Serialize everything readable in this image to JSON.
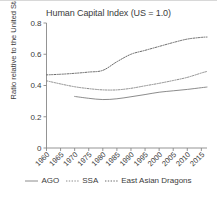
{
  "chart_data": {
    "type": "line",
    "title": "Human Capital Index (US = 1.0)",
    "xlabel": "",
    "ylabel": "Ratio relative to the United States",
    "xlim": [
      1960,
      2017
    ],
    "ylim": [
      0,
      0.8
    ],
    "grid": false,
    "legend_position": "bottom",
    "x_ticks": [
      1960,
      1965,
      1970,
      1975,
      1980,
      1985,
      1990,
      1995,
      2000,
      2005,
      2010,
      2015
    ],
    "x_tick_labels": [
      "1960",
      "1965",
      "1970",
      "1975",
      "1980",
      "1985",
      "1990",
      "1995",
      "2000",
      "2005",
      "2010",
      "2015"
    ],
    "y_ticks": [
      0,
      0.2,
      0.4,
      0.6,
      0.8
    ],
    "y_tick_labels": [
      "0",
      "0.2",
      "0.4",
      "0.6",
      "0.8"
    ],
    "series": [
      {
        "name": "AGO",
        "style": "solid",
        "color": "#8c8c8c",
        "x": [
          1970,
          1975,
          1980,
          1985,
          1990,
          1995,
          2000,
          2005,
          2010,
          2015,
          2017
        ],
        "values": [
          0.33,
          0.318,
          0.31,
          0.315,
          0.328,
          0.342,
          0.357,
          0.366,
          0.375,
          0.386,
          0.39
        ]
      },
      {
        "name": "SSA",
        "style": "dotted",
        "color": "#8c8c8c",
        "x": [
          1960,
          1965,
          1970,
          1975,
          1980,
          1985,
          1990,
          1995,
          2000,
          2005,
          2010,
          2015,
          2017
        ],
        "values": [
          0.43,
          0.41,
          0.392,
          0.38,
          0.372,
          0.372,
          0.382,
          0.398,
          0.414,
          0.432,
          0.452,
          0.48,
          0.49
        ]
      },
      {
        "name": "East Asian Dragons",
        "style": "dotted",
        "color": "#6b6b6b",
        "x": [
          1960,
          1965,
          1970,
          1975,
          1980,
          1985,
          1990,
          1995,
          2000,
          2005,
          2010,
          2015,
          2017
        ],
        "values": [
          0.468,
          0.472,
          0.478,
          0.486,
          0.497,
          0.552,
          0.6,
          0.625,
          0.65,
          0.675,
          0.697,
          0.708,
          0.71
        ]
      }
    ]
  },
  "legend": {
    "items": [
      {
        "label": "AGO"
      },
      {
        "label": "SSA"
      },
      {
        "label": "East Asian Dragons"
      }
    ]
  }
}
